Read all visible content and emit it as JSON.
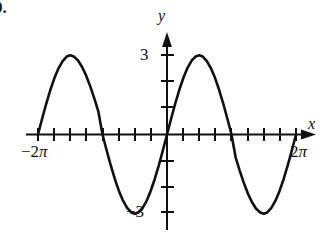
{
  "problem": {
    "number": "9."
  },
  "figure": {
    "name": "trigonometric-graph",
    "axes": {
      "x_axis_label": "x",
      "y_axis_label": "y"
    },
    "tick_labels": {
      "y_positive": "3",
      "y_negative": "−3",
      "x_left": "−2",
      "x_left_pi": "π",
      "x_right": "2",
      "x_right_pi": "π"
    },
    "colors": {
      "curve": "#111111",
      "axis": "#111111",
      "background": "#ffffff"
    }
  },
  "chart_data": {
    "type": "line",
    "title": "",
    "xlabel": "x",
    "ylabel": "y",
    "xlim": [
      -6.283185307,
      6.283185307
    ],
    "ylim": [
      -3.6,
      3.6
    ],
    "grid": false,
    "legend": null,
    "function": "y = 3 sin(x)",
    "amplitude": 3,
    "period": 6.283185307,
    "x_tick_labels": [
      "−2π",
      "2π"
    ],
    "x_tick_values": [
      -6.283185307,
      6.283185307
    ],
    "x_minor_tick_spacing": "π/4",
    "y_tick_labels": [
      "3",
      "−3"
    ],
    "y_tick_values": [
      3,
      -3
    ],
    "y_minor_tick_spacing": 1,
    "annotations": [
      {
        "label": "maximum",
        "x": -4.71238898,
        "y": 3
      },
      {
        "label": "zero",
        "x": -3.141592653,
        "y": 0
      },
      {
        "label": "minimum",
        "x": -1.570796327,
        "y": -3
      },
      {
        "label": "zero",
        "x": 0,
        "y": 0
      },
      {
        "label": "maximum",
        "x": 1.570796327,
        "y": 3
      },
      {
        "label": "zero",
        "x": 3.141592653,
        "y": 0
      },
      {
        "label": "minimum",
        "x": 4.71238898,
        "y": -3
      },
      {
        "label": "zero",
        "x": 6.283185307,
        "y": 0
      }
    ],
    "x": [
      -6.2832,
      -6.0832,
      -5.8832,
      -5.6832,
      -5.4832,
      -5.2832,
      -5.0832,
      -4.8832,
      -4.7124,
      -4.5416,
      -4.3416,
      -4.1416,
      -3.9416,
      -3.7416,
      -3.5416,
      -3.3416,
      -3.1416,
      -2.9416,
      -2.7416,
      -2.5416,
      -2.3416,
      -2.1416,
      -1.9416,
      -1.7416,
      -1.5708,
      -1.4,
      -1.2,
      -1.0,
      -0.8,
      -0.6,
      -0.4,
      -0.2,
      0,
      0.2,
      0.4,
      0.6,
      0.8,
      1.0,
      1.2,
      1.4,
      1.5708,
      1.7416,
      1.9416,
      2.1416,
      2.3416,
      2.5416,
      2.7416,
      2.9416,
      3.1416,
      3.3416,
      3.5416,
      3.7416,
      3.9416,
      4.1416,
      4.3416,
      4.5416,
      4.7124,
      4.8832,
      5.0832,
      5.2832,
      5.4832,
      5.6832,
      5.8832,
      6.0832,
      6.2832
    ],
    "y": [
      0,
      0.596,
      1.164,
      1.684,
      2.136,
      2.506,
      2.782,
      2.954,
      3.0,
      2.954,
      2.81,
      2.568,
      2.238,
      1.833,
      1.368,
      0.862,
      0,
      -0.596,
      -1.164,
      -1.684,
      -2.136,
      -2.506,
      -2.782,
      -2.954,
      -3.0,
      -2.954,
      -2.796,
      -2.524,
      -2.151,
      -1.694,
      -1.168,
      -0.596,
      0,
      0.596,
      1.168,
      1.694,
      2.151,
      2.524,
      2.796,
      2.954,
      3.0,
      2.954,
      2.782,
      2.506,
      2.136,
      1.684,
      1.164,
      0.596,
      0,
      -0.862,
      -1.368,
      -1.833,
      -2.238,
      -2.568,
      -2.81,
      -2.954,
      -3.0,
      -2.954,
      -2.782,
      -2.506,
      -2.136,
      -1.684,
      -1.164,
      -0.596,
      0
    ]
  }
}
